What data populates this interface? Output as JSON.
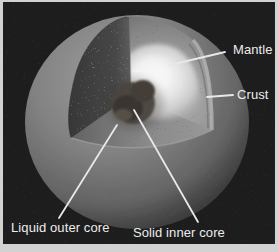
{
  "figure": {
    "name": "Earth interior cutaway diagram",
    "labels": {
      "mantle": "Mantle",
      "crust": "Crust",
      "liquid_outer_core": "Liquid outer core",
      "solid_inner_core": "Solid inner core"
    },
    "colors": {
      "frame": "#d2d2d2",
      "panel_background": "#1d1d1d",
      "label_text": "#ededed",
      "leader_line": "#e8e8e8",
      "sphere_surface": "#7e7e7e",
      "mantle_cut_face": "#9a9a9a",
      "crust_band": "#b0b0b0",
      "outer_core_glow": "#f2f2f2",
      "inner_core": "#453e38"
    }
  }
}
